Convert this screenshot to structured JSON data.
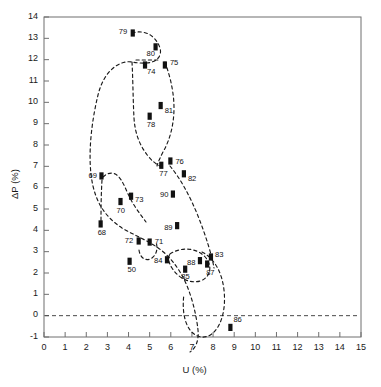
{
  "chart_data": {
    "type": "scatter",
    "title": "",
    "xlabel": "U (%)",
    "ylabel": "ΔP (%)",
    "xlim": [
      0,
      15
    ],
    "ylim": [
      -1,
      14
    ],
    "xticks": [
      "0",
      "1",
      "2",
      "3",
      "4",
      "5",
      "6",
      "7",
      "8",
      "9",
      "10",
      "11",
      "12",
      "13",
      "14",
      "15"
    ],
    "yticks": [
      "-1",
      "0",
      "1",
      "2",
      "3",
      "4",
      "5",
      "6",
      "7",
      "8",
      "9",
      "10",
      "11",
      "12",
      "13",
      "14"
    ],
    "grid": false,
    "legend": "none",
    "reference_line": {
      "axis": "y",
      "value": 0,
      "style": "dashed"
    },
    "marker_style": "filled-rectangle",
    "connector_style": "dashed-curve",
    "annotation_note": "Each point is labelled with a two-digit year; points are joined by dashed curves forming loops.",
    "points": [
      {
        "label": "50",
        "x": 4.05,
        "y": 2.55,
        "lx": -2,
        "ly": 8
      },
      {
        "label": "68",
        "x": 2.68,
        "y": 4.3,
        "lx": -3,
        "ly": 8
      },
      {
        "label": "69",
        "x": 2.72,
        "y": 6.55,
        "lx": -13,
        "ly": -1
      },
      {
        "label": "70",
        "x": 3.62,
        "y": 5.35,
        "lx": -4,
        "ly": 8
      },
      {
        "label": "71",
        "x": 5.0,
        "y": 3.45,
        "lx": 5,
        "ly": -1
      },
      {
        "label": "72",
        "x": 4.48,
        "y": 3.5,
        "lx": -14,
        "ly": -1
      },
      {
        "label": "73",
        "x": 4.12,
        "y": 5.6,
        "lx": 4,
        "ly": 3
      },
      {
        "label": "74",
        "x": 4.78,
        "y": 11.75,
        "lx": 2,
        "ly": 6
      },
      {
        "label": "75",
        "x": 5.72,
        "y": 11.75,
        "lx": 5,
        "ly": -3
      },
      {
        "label": "76",
        "x": 5.98,
        "y": 7.25,
        "lx": 5,
        "ly": 0
      },
      {
        "label": "77",
        "x": 5.55,
        "y": 7.05,
        "lx": -2,
        "ly": 8
      },
      {
        "label": "78",
        "x": 5.0,
        "y": 9.35,
        "lx": -3,
        "ly": 8
      },
      {
        "label": "79",
        "x": 4.2,
        "y": 13.25,
        "lx": -14,
        "ly": -2
      },
      {
        "label": "80",
        "x": 5.28,
        "y": 12.6,
        "lx": -9,
        "ly": 6
      },
      {
        "label": "81",
        "x": 5.52,
        "y": 9.85,
        "lx": 4,
        "ly": 4
      },
      {
        "label": "82",
        "x": 6.62,
        "y": 6.65,
        "lx": 4,
        "ly": 4
      },
      {
        "label": "83",
        "x": 7.9,
        "y": 2.75,
        "lx": 4,
        "ly": -3
      },
      {
        "label": "84",
        "x": 5.82,
        "y": 2.62,
        "lx": -13,
        "ly": 0
      },
      {
        "label": "85",
        "x": 6.68,
        "y": 2.18,
        "lx": -4,
        "ly": 7
      },
      {
        "label": "86",
        "x": 8.82,
        "y": -0.55,
        "lx": 3,
        "ly": -8
      },
      {
        "label": "87",
        "x": 7.72,
        "y": 2.42,
        "lx": -1,
        "ly": 8
      },
      {
        "label": "88",
        "x": 7.38,
        "y": 2.58,
        "lx": -13,
        "ly": 1
      },
      {
        "label": "89",
        "x": 6.3,
        "y": 4.22,
        "lx": -13,
        "ly": 1
      },
      {
        "label": "90",
        "x": 6.1,
        "y": 5.7,
        "lx": -13,
        "ly": 0
      }
    ],
    "paths": [
      {
        "name": "main-loop",
        "d": "M 132 33 C 145 29 156 36 160 48 C 162 55 158 60 152 62 C 146 64 138 63 132 62 C 120 60 104 70 98 95 C 90 128 86 170 96 196 C 101 210 110 220 122 228 C 132 234 142 238 152 244 C 164 251 172 259 180 272 C 190 288 196 312 198 330 C 199 340 196 348 190 352"
      },
      {
        "name": "inner-loop-74-81",
        "d": "M 132 62 C 133 80 133 100 134 118 C 135 134 140 146 148 156 C 152 161 156 164 160 166"
      },
      {
        "name": "loop-75-76",
        "d": "M 165 62 C 170 76 174 92 174 108 C 174 124 170 140 163 152 C 160 158 158 162 157 166"
      },
      {
        "name": "connector-74-75",
        "d": "M 136 60 L 160 60"
      },
      {
        "name": "loop-right",
        "d": "M 170 166 C 180 178 190 196 198 216 C 206 236 212 256 214 268"
      },
      {
        "name": "loop-69-70-73",
        "d": "M 103 177 C 108 172 114 172 118 176 C 123 181 126 190 130 198 C 134 206 140 214 146 222"
      },
      {
        "name": "left-drop",
        "d": "M 102 180 C 101 196 101 212 101 228"
      },
      {
        "name": "loop-72-71",
        "d": "M 139 250 C 140 258 146 262 152 258 C 157 254 158 248 156 242"
      },
      {
        "name": "loop-84-85-88",
        "d": "M 170 254 C 182 246 198 248 206 258 C 213 267 210 278 200 281 C 190 284 178 278 172 268 C 168 262 168 257 170 254"
      },
      {
        "name": "loop-86-87-88",
        "d": "M 202 252 C 214 258 222 272 224 290 C 226 308 222 324 214 332 C 206 340 196 338 190 330 C 184 322 182 308 184 294"
      }
    ]
  }
}
